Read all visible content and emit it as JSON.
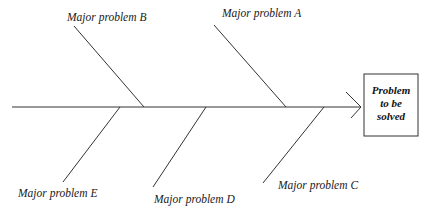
{
  "diagram": {
    "type": "fishbone",
    "effect": {
      "lines": [
        "Problem",
        "to be",
        "solved"
      ]
    },
    "causes": [
      {
        "id": "A",
        "label": "Major problem A",
        "side": "top"
      },
      {
        "id": "B",
        "label": "Major problem B",
        "side": "top"
      },
      {
        "id": "C",
        "label": "Major problem C",
        "side": "bottom"
      },
      {
        "id": "D",
        "label": "Major problem D",
        "side": "bottom"
      },
      {
        "id": "E",
        "label": "Major problem E",
        "side": "bottom"
      }
    ],
    "colors": {
      "line": "#333333",
      "text": "#1a1a1a",
      "background": "#ffffff"
    }
  }
}
